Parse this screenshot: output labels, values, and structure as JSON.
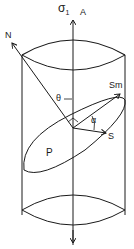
{
  "diagram": {
    "type": "cylinder-stress-schematic",
    "labels": {
      "sigma": "σ",
      "sigma_sub": "1",
      "axis": "A",
      "normal": "N",
      "theta": "θ",
      "max_shear": "Sm",
      "alpha": "α",
      "shear": "S",
      "plane": "P"
    },
    "colors": {
      "stroke": "#1a1a1a",
      "background": "#ffffff"
    }
  }
}
